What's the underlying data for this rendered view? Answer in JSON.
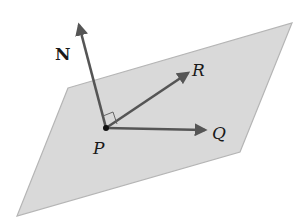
{
  "diagram": {
    "colors": {
      "plane_fill": "#d9d9d9",
      "plane_edge": "#b5b5b5",
      "vector": "#555555",
      "point": "#111111",
      "text": "#1a1a1a"
    },
    "labels": {
      "normal": "N",
      "point": "P",
      "vector_r": "R",
      "vector_q": "Q"
    }
  }
}
